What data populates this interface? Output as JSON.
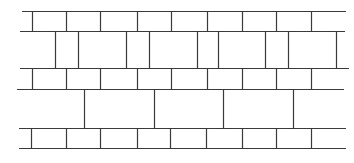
{
  "diagram": {
    "line_color": "#3a3a3a",
    "background": "#ffffff",
    "stroke_width": 1.2,
    "courses": [
      {
        "name": "course-1",
        "top": 11,
        "bottom": 31,
        "left": 22,
        "right": 346,
        "joints": [
          32,
          66,
          100,
          137,
          171,
          207,
          242,
          276,
          311
        ]
      },
      {
        "name": "course-2",
        "top": 31,
        "bottom": 68,
        "left": 20,
        "right": 345,
        "joints": [
          55,
          78,
          126,
          149,
          197,
          218,
          265,
          288,
          336
        ]
      },
      {
        "name": "course-3",
        "top": 68,
        "bottom": 89,
        "left": 20,
        "right": 349,
        "joints": [
          32,
          66,
          100,
          137,
          171,
          207,
          242,
          276,
          311
        ]
      },
      {
        "name": "course-4",
        "top": 89,
        "bottom": 128,
        "left": 17,
        "right": 344,
        "joints": [
          84,
          154,
          223,
          293
        ]
      },
      {
        "name": "course-5",
        "top": 128,
        "bottom": 148,
        "left": 19,
        "right": 346,
        "joints": [
          31,
          66,
          100,
          137,
          170,
          206,
          242,
          276,
          311
        ]
      }
    ],
    "bed_lines": [
      {
        "y": 11,
        "x1": 22,
        "x2": 346
      },
      {
        "y": 31,
        "x1": 20,
        "x2": 345
      },
      {
        "y": 68,
        "x1": 20,
        "x2": 349
      },
      {
        "y": 89,
        "x1": 17,
        "x2": 344
      },
      {
        "y": 128,
        "x1": 19,
        "x2": 346
      },
      {
        "y": 148,
        "x1": 19,
        "x2": 346
      }
    ]
  }
}
